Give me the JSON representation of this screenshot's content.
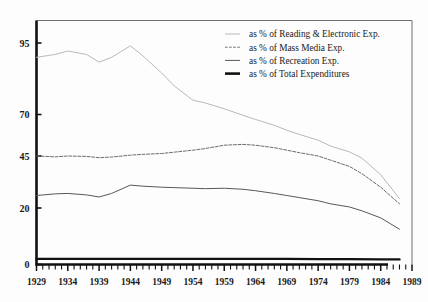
{
  "chart_data": {
    "type": "line",
    "title": "",
    "xlabel": "",
    "ylabel": "",
    "xlim": [
      1929,
      1989
    ],
    "ylim": [
      0,
      104
    ],
    "grid": false,
    "legend_position": "top-right",
    "x_tick_labels": [
      "1929",
      "1934",
      "1939",
      "1944",
      "1949",
      "1954",
      "1959",
      "1964",
      "1969",
      "1974",
      "1979",
      "1984",
      "1989"
    ],
    "x_tick_values": [
      1929,
      1934,
      1939,
      1944,
      1949,
      1954,
      1959,
      1964,
      1969,
      1974,
      1979,
      1984,
      1989
    ],
    "minor_x_ticks_every": 1,
    "y_tick_labels": [
      "0",
      "20",
      "45",
      "70",
      "95"
    ],
    "y_tick_values": [
      0,
      20,
      45,
      70,
      95
    ],
    "series": [
      {
        "name": "as % of Reading & Electronic Exp.",
        "style": "solid",
        "color": "#b9b9b9",
        "width": 1.0,
        "x": [
          1929,
          1932,
          1934,
          1937,
          1939,
          1941,
          1944,
          1946,
          1949,
          1951,
          1954,
          1956,
          1959,
          1962,
          1964,
          1967,
          1969,
          1971,
          1974,
          1976,
          1979,
          1981,
          1984,
          1987
        ],
        "values": [
          90.0,
          91.0,
          92.2,
          91.0,
          88.3,
          90.0,
          94.0,
          90.5,
          84.5,
          80.0,
          75.0,
          74.0,
          72.0,
          69.5,
          67.0,
          63.5,
          60.5,
          58.0,
          54.5,
          51.0,
          47.5,
          44.0,
          36.0,
          24.5
        ]
      },
      {
        "name": "as % of Mass Media Exp.",
        "style": "dashed",
        "color": "#6d6d6d",
        "width": 1.0,
        "x": [
          1929,
          1932,
          1934,
          1937,
          1939,
          1941,
          1944,
          1946,
          1949,
          1951,
          1954,
          1956,
          1959,
          1962,
          1964,
          1967,
          1969,
          1971,
          1974,
          1976,
          1979,
          1981,
          1984,
          1987
        ],
        "values": [
          45.0,
          44.6,
          45.0,
          44.8,
          44.2,
          44.5,
          45.5,
          46.0,
          46.5,
          47.3,
          48.5,
          49.5,
          51.5,
          52.0,
          51.5,
          50.0,
          48.5,
          47.0,
          45.0,
          43.0,
          40.0,
          36.5,
          30.0,
          22.0
        ]
      },
      {
        "name": "as % of Recreation Exp.",
        "style": "solid",
        "color": "#585858",
        "width": 1.0,
        "x": [
          1929,
          1932,
          1934,
          1937,
          1939,
          1941,
          1944,
          1946,
          1949,
          1951,
          1954,
          1956,
          1959,
          1962,
          1964,
          1967,
          1969,
          1971,
          1974,
          1976,
          1979,
          1981,
          1984,
          1987
        ],
        "values": [
          26.0,
          26.8,
          27.0,
          26.3,
          25.3,
          27.0,
          31.0,
          30.5,
          30.0,
          29.8,
          29.5,
          29.3,
          29.5,
          29.0,
          28.3,
          27.0,
          26.0,
          25.0,
          23.5,
          22.0,
          20.5,
          19.0,
          16.5,
          12.5
        ]
      },
      {
        "name": "as % of Total Expenditures",
        "style": "solid-thick",
        "color": "#111111",
        "width": 2.4,
        "x": [
          1929,
          1934,
          1939,
          1944,
          1949,
          1954,
          1959,
          1964,
          1969,
          1974,
          1979,
          1984,
          1987
        ],
        "values": [
          2.0,
          2.0,
          2.0,
          2.0,
          2.0,
          2.0,
          2.0,
          2.0,
          2.0,
          1.9,
          1.9,
          1.8,
          1.8
        ]
      }
    ]
  },
  "legend": {
    "entries": [
      {
        "label": "as % of Reading & Electronic Exp."
      },
      {
        "label": "as % of Mass Media Exp."
      },
      {
        "label": "as % of Recreation Exp."
      },
      {
        "label": "as % of Total Expenditures"
      }
    ]
  }
}
